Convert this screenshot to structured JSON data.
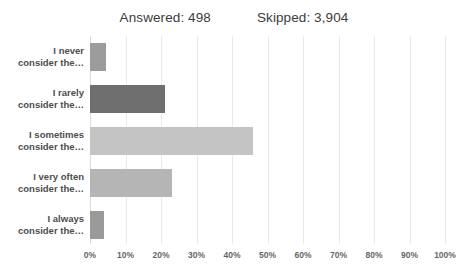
{
  "header": {
    "answered_label": "Answered: 498",
    "skipped_label": "Skipped: 3,904"
  },
  "chart_data": {
    "type": "bar",
    "orientation": "horizontal",
    "title": "",
    "xlabel": "",
    "ylabel": "",
    "xlim": [
      0,
      100
    ],
    "grid": true,
    "legend": false,
    "categories": [
      "I never consider the…",
      "I rarely consider the…",
      "I sometimes consider the…",
      "I very often consider the…",
      "I always consider the…"
    ],
    "category_lines": [
      [
        "I never",
        "consider the…"
      ],
      [
        "I rarely",
        "consider the…"
      ],
      [
        "I sometimes",
        "consider the…"
      ],
      [
        "I very often",
        "consider the…"
      ],
      [
        "I always",
        "consider the…"
      ]
    ],
    "values": [
      4.5,
      21,
      46,
      23,
      4
    ],
    "bar_colors": [
      "#9c9c9c",
      "#6e6e6e",
      "#c4c4c4",
      "#b5b5b5",
      "#9a9a9a"
    ],
    "tick_labels": [
      "0%",
      "10%",
      "20%",
      "30%",
      "40%",
      "50%",
      "60%",
      "70%",
      "80%",
      "90%",
      "100%"
    ],
    "tick_values": [
      0,
      10,
      20,
      30,
      40,
      50,
      60,
      70,
      80,
      90,
      100
    ]
  }
}
